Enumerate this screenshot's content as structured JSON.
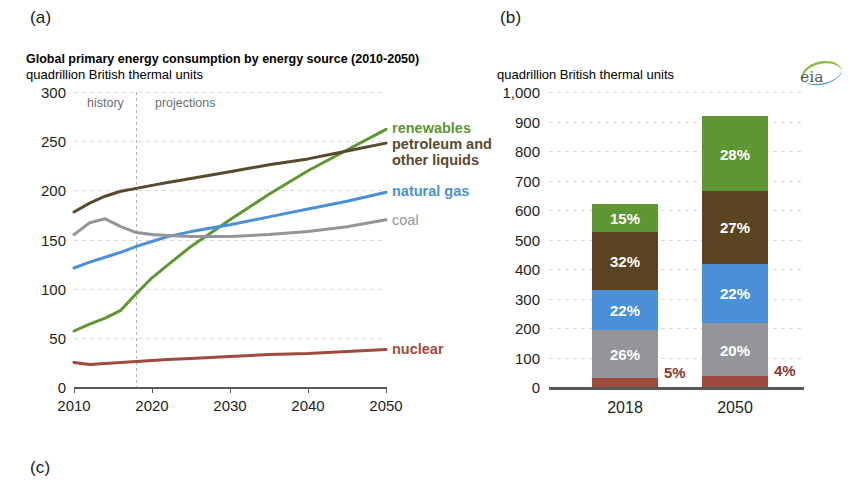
{
  "panels": {
    "a": "(a)",
    "b": "(b)",
    "c": "(c)"
  },
  "logo": {
    "text": "eia",
    "colors": {
      "green": "#8cbe3f",
      "blue": "#4da3d8",
      "ink": "#4f5b5e"
    }
  },
  "chart_data": [
    {
      "id": "panel-a",
      "type": "line",
      "title": "Global primary energy consumption by energy source (2010-2050)",
      "subtitle": "quadrillion British thermal units",
      "xlabel": "",
      "ylabel": "",
      "xlim": [
        2010,
        2050
      ],
      "ylim": [
        0,
        300
      ],
      "yticks": [
        "300",
        "250",
        "200",
        "150",
        "100",
        "50",
        "0"
      ],
      "ytick_values": [
        300,
        250,
        200,
        150,
        100,
        50,
        0
      ],
      "xticks": [
        "2010",
        "2020",
        "2030",
        "2040",
        "2050"
      ],
      "xtick_values": [
        2010,
        2020,
        2030,
        2040,
        2050
      ],
      "grid": true,
      "legend_position": "right-inline",
      "annotations": [
        {
          "text": "history",
          "x": 2015,
          "y": 288
        },
        {
          "text": "projections",
          "x": 2025,
          "y": 288
        }
      ],
      "divider_x": 2018,
      "x": [
        2010,
        2012,
        2014,
        2016,
        2018,
        2020,
        2022,
        2025,
        2030,
        2035,
        2040,
        2045,
        2050
      ],
      "series": [
        {
          "name": "renewables",
          "color": "#5e9732",
          "label_color": "#5e9732",
          "values": [
            57,
            64,
            70,
            78,
            95,
            111,
            124,
            143,
            170,
            196,
            220,
            241,
            262
          ]
        },
        {
          "name": "petroleum and other liquids",
          "color": "#594a2e",
          "label_color": "#594a2e",
          "values": [
            178,
            187,
            194,
            199,
            202,
            205,
            208,
            212,
            219,
            226,
            232,
            240,
            248
          ]
        },
        {
          "name": "natural gas",
          "color": "#4a90d9",
          "label_color": "#4a90d9",
          "values": [
            121,
            127,
            132,
            137,
            143,
            148,
            153,
            158,
            165,
            173,
            181,
            189,
            198
          ]
        },
        {
          "name": "coal",
          "color": "#939598",
          "label_color": "#939598",
          "values": [
            155,
            167,
            171,
            163,
            157,
            155,
            154,
            153,
            153,
            155,
            158,
            163,
            170
          ]
        },
        {
          "name": "nuclear",
          "color": "#9e4a3c",
          "label_color": "#9e4a3c",
          "values": [
            25,
            23,
            24,
            25,
            26,
            27,
            28,
            29,
            31,
            33,
            34,
            36,
            38
          ]
        }
      ],
      "legend_entries": [
        {
          "label": "renewables",
          "color": "#5e9732",
          "bold": true
        },
        {
          "label": "petroleum and",
          "color": "#594a2e",
          "bold": true
        },
        {
          "label": "other liquids",
          "color": "#594a2e",
          "bold": true
        },
        {
          "label": "natural gas",
          "color": "#4a90d9",
          "bold": true
        },
        {
          "label": "coal",
          "color": "#939598",
          "bold": false
        },
        {
          "label": "nuclear",
          "color": "#9e4a3c",
          "bold": true
        }
      ]
    },
    {
      "id": "panel-b",
      "type": "bar",
      "subtitle": "quadrillion British thermal units",
      "stacked": true,
      "categories": [
        "2018",
        "2050"
      ],
      "ylim": [
        0,
        1000
      ],
      "yticks": [
        "1,000",
        "900",
        "800",
        "700",
        "600",
        "500",
        "400",
        "300",
        "200",
        "100",
        "0"
      ],
      "ytick_values": [
        1000,
        900,
        800,
        700,
        600,
        500,
        400,
        300,
        200,
        100,
        0
      ],
      "grid": true,
      "totals": [
        620,
        910
      ],
      "series": [
        {
          "name": "nuclear",
          "color": "#9e4a3c",
          "values": [
            31,
            36
          ],
          "labels": [
            "5%",
            "4%"
          ],
          "label_outside": [
            true,
            true
          ]
        },
        {
          "name": "coal",
          "color": "#939598",
          "values": [
            161,
            182
          ],
          "labels": [
            "26%",
            "20%"
          ],
          "label_outside": [
            false,
            false
          ]
        },
        {
          "name": "natural gas",
          "color": "#4a90d9",
          "values": [
            136,
            200
          ],
          "labels": [
            "22%",
            "22%"
          ],
          "label_outside": [
            false,
            false
          ]
        },
        {
          "name": "petroleum and other liquids",
          "color": "#5b4422",
          "values": [
            198,
            246
          ],
          "labels": [
            "32%",
            "27%"
          ],
          "label_outside": [
            false,
            false
          ]
        },
        {
          "name": "renewables",
          "color": "#5e9732",
          "values": [
            93,
            255
          ],
          "labels": [
            "15%",
            "28%"
          ],
          "label_outside": [
            false,
            false
          ]
        }
      ]
    }
  ]
}
